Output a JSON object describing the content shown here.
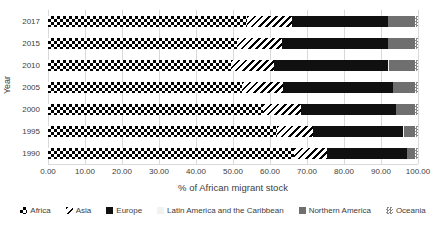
{
  "chart_data": {
    "type": "bar",
    "orientation": "horizontal-stacked",
    "title": "",
    "xlabel": "% of African migrant stock",
    "ylabel": "Year",
    "xlim": [
      0,
      100
    ],
    "x_ticks": [
      "0.00",
      "10.00",
      "20.00",
      "30.00",
      "40.00",
      "50.00",
      "60.00",
      "70.00",
      "80.00",
      "90.00",
      "100.00"
    ],
    "grid": "vertical-gridlines-on",
    "legend_position": "bottom",
    "categories": [
      "2017",
      "2015",
      "2010",
      "2005",
      "2000",
      "1995",
      "1990"
    ],
    "series": [
      {
        "name": "Africa",
        "pattern": "checkerboard",
        "color": "#000000",
        "values": [
          53.8,
          51.0,
          49.5,
          52.5,
          58.0,
          62.0,
          66.5
        ]
      },
      {
        "name": "Asia",
        "pattern": "diagonal-stripes",
        "color": "#000000",
        "values": [
          12.2,
          12.2,
          11.5,
          11.0,
          10.5,
          9.7,
          9.0
        ]
      },
      {
        "name": "Europe",
        "pattern": "solid",
        "color": "#101010",
        "values": [
          25.9,
          28.7,
          31.0,
          29.7,
          25.5,
          24.3,
          21.5
        ]
      },
      {
        "name": "Latin America and the Caribbean",
        "pattern": "solid",
        "color": "#f2f2f2",
        "values": [
          0.1,
          0.1,
          0.1,
          0.1,
          0.1,
          0.1,
          0.1
        ]
      },
      {
        "name": "Northern America",
        "pattern": "solid",
        "color": "#6f6f6f",
        "values": [
          7.3,
          7.3,
          7.2,
          6.0,
          5.2,
          3.2,
          2.2
        ]
      },
      {
        "name": "Oceania",
        "pattern": "fine-grid",
        "color": "#a6a6a6",
        "values": [
          0.7,
          0.7,
          0.7,
          0.7,
          0.7,
          0.7,
          0.7
        ]
      }
    ]
  }
}
